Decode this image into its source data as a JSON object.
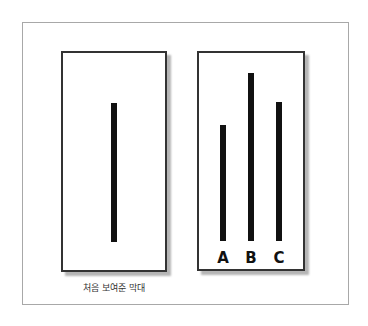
{
  "figure": {
    "standard_panel": {
      "caption": "처음 보여준 막대",
      "bar": {
        "top": 103,
        "bottom": 242,
        "left": 111
      }
    },
    "comparison_panel": {
      "bars": [
        {
          "label": "A",
          "top": 125,
          "bottom": 241,
          "left": 220
        },
        {
          "label": "B",
          "top": 73,
          "bottom": 241,
          "left": 248
        },
        {
          "label": "C",
          "top": 102,
          "bottom": 241,
          "left": 276
        }
      ]
    },
    "colors": {
      "bar": "#111111",
      "border": "#333333",
      "shadow": "#b5b5b5",
      "frame": "#a8a8a8"
    }
  }
}
